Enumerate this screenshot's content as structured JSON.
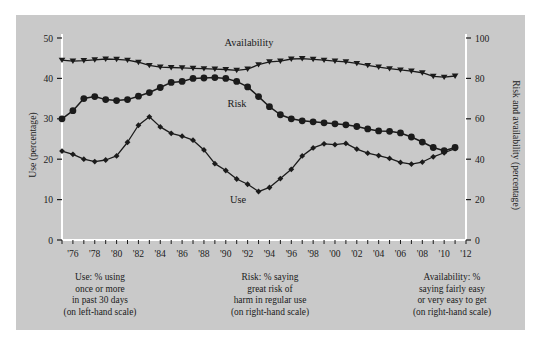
{
  "panel": {
    "background_color": "#c9c9c9",
    "outer_background_color": "#ffffff",
    "ink_color": "#1b1b1b"
  },
  "captions": {
    "use": "Use: % using\nonce or more\nin past 30 days\n(on left-hand scale)",
    "risk": "Risk: % saying\ngreat risk of\nharm in regular use\n(on right-hand scale)",
    "availability": "Availability: %\nsaying fairly easy\nor very easy to get\n(on right-hand scale)"
  },
  "labels": {
    "left_axis": "Use (percentage)",
    "right_axis": "Risk and availability (percentage)",
    "series_use": "Use",
    "series_risk": "Risk",
    "series_availability": "Availability"
  },
  "axes": {
    "left_ticks": [
      "0",
      "10",
      "20",
      "30",
      "40",
      "50"
    ],
    "right_ticks": [
      "0",
      "20",
      "40",
      "60",
      "80",
      "100"
    ],
    "x_ticks": [
      "'76",
      "'78",
      "'80",
      "'82",
      "'84",
      "'86",
      "'88",
      "'90",
      "'92",
      "'94",
      "'96",
      "'98",
      "'00",
      "'02",
      "'04",
      "'06",
      "'08",
      "'10",
      "'12"
    ]
  },
  "chart_data": {
    "type": "line",
    "title": "",
    "xlabel": "",
    "ylabel": "Use (percentage)",
    "y2label": "Risk and availability (percentage)",
    "xlim": [
      1975,
      2012
    ],
    "ylim": [
      0,
      50
    ],
    "y2lim": [
      0,
      100
    ],
    "grid": false,
    "legend": "inline-annotations",
    "x": [
      1975,
      1976,
      1977,
      1978,
      1979,
      1980,
      1981,
      1982,
      1983,
      1984,
      1985,
      1986,
      1987,
      1988,
      1989,
      1990,
      1991,
      1992,
      1993,
      1994,
      1995,
      1996,
      1997,
      1998,
      1999,
      2000,
      2001,
      2002,
      2003,
      2004,
      2005,
      2006,
      2007,
      2008,
      2009,
      2010,
      2011
    ],
    "series": [
      {
        "name": "Use",
        "axis": "left",
        "marker": "diamond",
        "unit": "percentage using once or more in past 30 days",
        "values": [
          22.0,
          21.2,
          20.0,
          19.4,
          19.8,
          20.8,
          24.2,
          28.4,
          30.5,
          28.0,
          26.4,
          25.7,
          24.7,
          22.3,
          18.9,
          17.2,
          15.1,
          13.8,
          12.0,
          13.0,
          15.2,
          17.5,
          20.8,
          22.8,
          23.8,
          23.6,
          23.9,
          22.5,
          21.5,
          20.9,
          20.2,
          19.2,
          18.8,
          19.3,
          20.6,
          21.6,
          22.6
        ],
        "values_right_scale_equivalent": null
      },
      {
        "name": "Risk",
        "axis": "right",
        "marker": "circle",
        "unit": "percentage saying great risk of harm in regular use",
        "values": [
          60.0,
          64.0,
          70.0,
          71.0,
          69.5,
          69.0,
          69.5,
          71.2,
          73.0,
          75.5,
          78.0,
          78.5,
          80.0,
          80.2,
          80.4,
          80.0,
          78.5,
          75.8,
          71.0,
          66.0,
          62.0,
          60.0,
          59.0,
          58.5,
          58.0,
          57.5,
          57.0,
          56.2,
          55.0,
          54.0,
          53.8,
          53.0,
          51.0,
          48.5,
          45.8,
          44.2,
          45.8
        ],
        "left_scale_equivalent": [
          30.0,
          32.0,
          35.0,
          35.5,
          34.8,
          34.5,
          34.8,
          35.6,
          36.5,
          37.8,
          39.0,
          39.3,
          40.0,
          40.1,
          40.2,
          40.0,
          39.3,
          37.9,
          35.5,
          33.0,
          31.0,
          30.0,
          29.5,
          29.3,
          29.0,
          28.8,
          28.5,
          28.1,
          27.5,
          27.0,
          26.9,
          26.5,
          25.5,
          24.3,
          22.9,
          22.1,
          22.9
        ]
      },
      {
        "name": "Availability",
        "axis": "right",
        "marker": "triangle-down",
        "unit": "percentage saying fairly easy or very easy to get",
        "values": [
          89.0,
          88.6,
          88.8,
          89.2,
          89.6,
          89.4,
          89.0,
          88.0,
          86.4,
          85.6,
          85.4,
          85.2,
          85.0,
          84.8,
          84.6,
          84.4,
          84.0,
          84.6,
          86.8,
          88.2,
          88.6,
          89.6,
          89.8,
          89.4,
          89.0,
          88.6,
          88.2,
          87.4,
          86.4,
          85.6,
          84.8,
          84.2,
          83.6,
          82.8,
          81.0,
          80.6,
          81.2
        ],
        "left_scale_equivalent": [
          44.5,
          44.3,
          44.4,
          44.6,
          44.8,
          44.7,
          44.5,
          44.0,
          43.2,
          42.8,
          42.7,
          42.6,
          42.5,
          42.4,
          42.3,
          42.2,
          42.0,
          42.3,
          43.4,
          44.1,
          44.3,
          44.8,
          44.9,
          44.7,
          44.5,
          44.3,
          44.1,
          43.7,
          43.2,
          42.8,
          42.4,
          42.1,
          41.8,
          41.4,
          40.5,
          40.3,
          40.6
        ]
      }
    ]
  }
}
